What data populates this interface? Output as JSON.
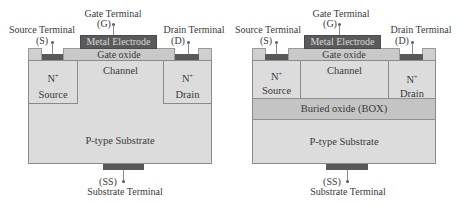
{
  "diagrams": [
    {
      "name": "bulk-mosfet",
      "labels": {
        "gate_terminal": "Gate Terminal",
        "gate_symbol": "(G)",
        "source_terminal": "Source Terminal",
        "source_symbol": "(S)",
        "drain_terminal": "Drain Terminal",
        "drain_symbol": "(D)",
        "metal_electrode": "Metal Electrode",
        "gate_oxide": "Gate oxide",
        "channel": "Channel",
        "source_doping": "N",
        "source_doping_sup": "+",
        "source": "Source",
        "drain_doping": "N",
        "drain_doping_sup": "+",
        "drain": "Drain",
        "substrate": "P-type Substrate",
        "substrate_symbol": "(SS)",
        "substrate_terminal": "Substrate Terminal"
      }
    },
    {
      "name": "soi-mosfet",
      "labels": {
        "gate_terminal": "Gate Terminal",
        "gate_symbol": "(G)",
        "source_terminal": "Source Terminal",
        "source_symbol": "(S)",
        "drain_terminal": "Drain Terminal",
        "drain_symbol": "(D)",
        "metal_electrode": "Metal Electrode",
        "gate_oxide": "Gate oxide",
        "channel": "Channel",
        "source_doping": "N",
        "source_doping_sup": "+",
        "source": "Source",
        "drain_doping": "N",
        "drain_doping_sup": "+",
        "drain": "Drain",
        "buried_oxide": "Buried oxide (BOX)",
        "substrate": "P-type Substrate",
        "substrate_symbol": "(SS)",
        "substrate_terminal": "Substrate Terminal"
      }
    }
  ],
  "colors": {
    "metal": "#5a5a5a",
    "oxide": "#c9c9c9",
    "silicon": "#dcdcdc",
    "buried_oxide": "#c4c4c4",
    "contact": "#595959"
  }
}
